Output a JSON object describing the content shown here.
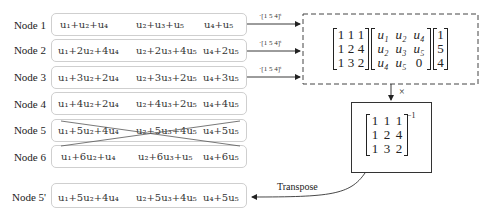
{
  "nodes": [
    {
      "label": "Node 1",
      "terms": [
        "u₁+u₂+u₄",
        "u₂+u₃+u₅",
        "u₄+u₅"
      ],
      "crossed": false,
      "arrow_label": "·[1 5 4]ᵗ"
    },
    {
      "label": "Node 2",
      "terms": [
        "u₁+2u₂+4u₄",
        "u₂+2u₃+4u₅",
        "u₄+2u₅"
      ],
      "crossed": false,
      "arrow_label": "·[1 5 4]ᵗ"
    },
    {
      "label": "Node 3",
      "terms": [
        "u₁+3u₂+2u₄",
        "u₂+3u₃+2u₅",
        "u₄+3u₅"
      ],
      "crossed": false,
      "arrow_label": "·[1 5 4]ᵗ"
    },
    {
      "label": "Node 4",
      "terms": [
        "u₁+4u₂+2u₄",
        "u₂+4u₃+2u₅",
        "u₄+4u₅"
      ],
      "crossed": false
    },
    {
      "label": "Node 5",
      "terms": [
        "u₁+5u₂+4u₄",
        "u₂+5u₃+4u₅",
        "u₄+5u₅"
      ],
      "crossed": true
    },
    {
      "label": "Node 6",
      "terms": [
        "u₁+6u₂+u₄",
        "u₂+6u₃+u₅",
        "u₄+6u₅"
      ],
      "crossed": false
    },
    {
      "label": "Node 5'",
      "terms": [
        "u₁+5u₂+4u₄",
        "u₂+5u₃+4u₅",
        "u₄+5u₅"
      ],
      "crossed": false
    }
  ],
  "product_box": {
    "coefficient_matrix": [
      [
        "1",
        "1",
        "1"
      ],
      [
        "1",
        "2",
        "4"
      ],
      [
        "1",
        "3",
        "2"
      ]
    ],
    "variable_matrix": [
      [
        "u₁",
        "u₂",
        "u₄"
      ],
      [
        "u₂",
        "u₃",
        "u₅"
      ],
      [
        "u₄",
        "u₅",
        "0"
      ]
    ],
    "vector": [
      [
        "1"
      ],
      [
        "5"
      ],
      [
        "4"
      ]
    ]
  },
  "multiply_label": "×",
  "inverse_box": {
    "matrix": [
      [
        "1",
        "1",
        "1"
      ],
      [
        "1",
        "2",
        "4"
      ],
      [
        "1",
        "3",
        "2"
      ]
    ],
    "superscript": "−1"
  },
  "transpose_label": "Transpose"
}
